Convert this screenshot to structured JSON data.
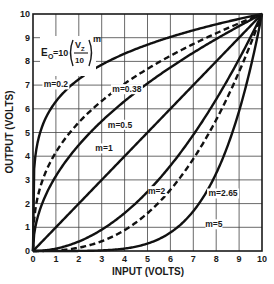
{
  "chart_data": {
    "type": "line",
    "title": "",
    "formula": {
      "lhs": "E",
      "lhs_sub": "O",
      "eq": "=10",
      "numerator": "V",
      "numerator_sub": "Z",
      "denominator": "10",
      "exponent": "m"
    },
    "xlabel": "INPUT (VOLTS)",
    "ylabel": "OUTPUT (VOLTS)",
    "xlim": [
      0,
      10
    ],
    "ylim": [
      0,
      10
    ],
    "xticks": [
      "0",
      "1",
      "2",
      "3",
      "4",
      "5",
      "6",
      "7",
      "8",
      "9",
      "10"
    ],
    "yticks": [
      "0",
      "1",
      "2",
      "3",
      "4",
      "5",
      "6",
      "7",
      "8",
      "9",
      "10"
    ],
    "grid": true,
    "legend": "none (inline annotations)",
    "function": "y = 10 * (x/10)^m",
    "series": [
      {
        "name": "m=0.2",
        "m": 0.2,
        "style": "solid"
      },
      {
        "name": "m=0.38",
        "m": 0.38,
        "style": "dashed"
      },
      {
        "name": "m=0.5",
        "m": 0.5,
        "style": "solid"
      },
      {
        "name": "m=1",
        "m": 1,
        "style": "solid"
      },
      {
        "name": "m=2",
        "m": 2,
        "style": "solid"
      },
      {
        "name": "m=2.65",
        "m": 2.65,
        "style": "dashed"
      },
      {
        "name": "m=5",
        "m": 5,
        "style": "solid"
      }
    ],
    "annotations": [
      {
        "text": "m=0.2",
        "x": 1.0,
        "y": 6.9
      },
      {
        "text": "m=0.38",
        "x": 4.1,
        "y": 6.7
      },
      {
        "text": "m=0.5",
        "x": 3.8,
        "y": 5.2
      },
      {
        "text": "m=1",
        "x": 3.1,
        "y": 4.2
      },
      {
        "text": "m=2",
        "x": 5.4,
        "y": 2.4
      },
      {
        "text": "m=2.65",
        "x": 8.3,
        "y": 2.3
      },
      {
        "text": "m=5",
        "x": 7.9,
        "y": 1.0
      }
    ]
  }
}
